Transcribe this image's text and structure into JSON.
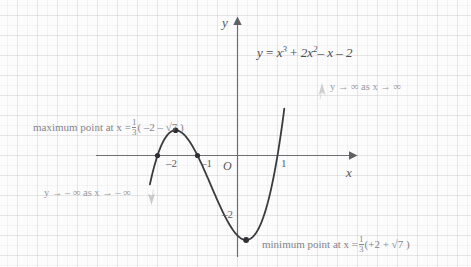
{
  "figure": {
    "equation": {
      "lhs": "y",
      "eq": "=",
      "term1_base": "x",
      "term1_exp": "3",
      "plus1": "+",
      "term2_coef": "2x",
      "term2_exp": "2",
      "term3": "– x – 2"
    },
    "axes": {
      "y_label": "y",
      "x_label": "x",
      "origin_label": "O",
      "x_ticks": [
        "–2",
        "–1",
        "1"
      ],
      "y_ticks": [
        "–2"
      ]
    },
    "annotations": {
      "max_point": {
        "text_before": "maximum point at x =",
        "frac_num": "1",
        "frac_den": "3",
        "bracket": "( –2 – √7 )"
      },
      "min_point": {
        "text_before": "minimum point at x =",
        "frac_num": "1",
        "frac_den": "3",
        "bracket": "(+2 + √7 )"
      },
      "end_behaviour_right": "y → ∞ as x → ∞",
      "end_behaviour_left": "y → – ∞ as x → – ∞"
    },
    "colors": {
      "curve": "#3b3b40",
      "axis": "#6e6e73",
      "grid": "#96969b",
      "note": "#9a9aa0",
      "background": "#fcfcfc"
    }
  },
  "chart_data": {
    "type": "line",
    "xlabel": "x",
    "ylabel": "y",
    "xlim": [
      -2.2,
      1.5
    ],
    "ylim": [
      -3.2,
      2.3
    ],
    "grid": true,
    "legend": "none",
    "function": "x^3 + 2x^2 - x - 2",
    "roots": [
      -2,
      -1,
      1
    ],
    "turning_points": [
      {
        "kind": "maximum",
        "x": -1.5486,
        "y": 0.6311,
        "x_exact": "(1/3)(-2 - sqrt(7))"
      },
      {
        "kind": "minimum",
        "x": 0.2153,
        "y": -2.1126,
        "x_exact": "(1/3)(2 + sqrt(7))"
      }
    ],
    "y_intercept": -2,
    "marked_points": [
      {
        "x": -2,
        "y": 0
      },
      {
        "x": -1,
        "y": 0
      },
      {
        "x": -1.5486,
        "y": 0.6311
      },
      {
        "x": 0.2153,
        "y": -2.1126
      }
    ],
    "x_tick_values": [
      -2,
      -1,
      1
    ],
    "y_tick_values": [
      -2
    ],
    "series": [
      {
        "name": "y = x^3 + 2x^2 - x - 2",
        "x": [
          -2.18,
          -2.1,
          -2.0,
          -1.9,
          -1.8,
          -1.7,
          -1.6,
          -1.55,
          -1.5,
          -1.4,
          -1.3,
          -1.2,
          -1.1,
          -1.0,
          -0.9,
          -0.8,
          -0.7,
          -0.6,
          -0.5,
          -0.4,
          -0.3,
          -0.2,
          -0.1,
          0.0,
          0.1,
          0.22,
          0.3,
          0.4,
          0.5,
          0.6,
          0.7,
          0.8,
          0.9,
          1.0,
          1.1,
          1.18
        ],
        "y": [
          -0.72,
          -0.34,
          0.0,
          0.26,
          0.45,
          0.57,
          0.62,
          0.63,
          0.62,
          0.58,
          0.48,
          0.35,
          0.19,
          0.0,
          -0.21,
          -0.43,
          -0.66,
          -0.9,
          -1.12,
          -1.34,
          -1.55,
          -1.73,
          -1.88,
          -2.0,
          -2.08,
          -2.11,
          -2.09,
          -2.02,
          -1.88,
          -1.66,
          -1.38,
          -1.01,
          -0.55,
          0.0,
          0.65,
          1.25
        ]
      }
    ]
  }
}
